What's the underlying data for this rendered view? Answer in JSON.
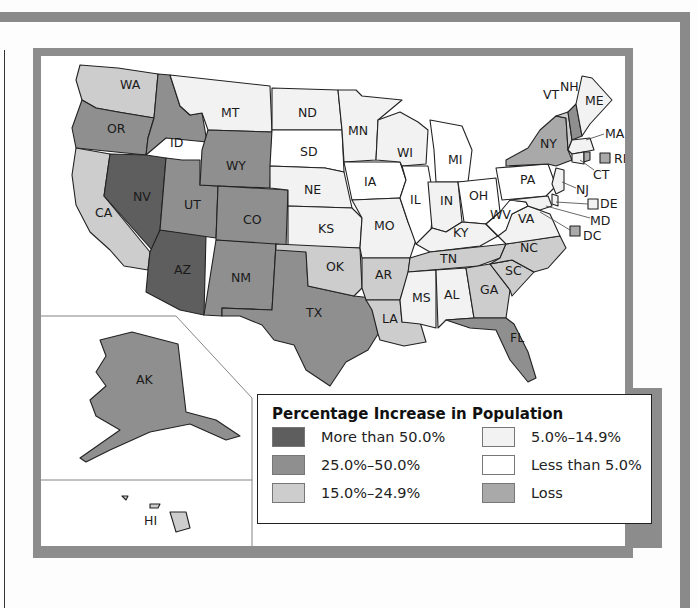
{
  "legend": {
    "title": "Percentage Increase in Population",
    "items": [
      {
        "label": "More than 50.0%",
        "color": "#5e5e5e"
      },
      {
        "label": "5.0%–14.9%",
        "color": "#f2f2f2"
      },
      {
        "label": "25.0%–50.0%",
        "color": "#8f8f8f"
      },
      {
        "label": "Less than 5.0%",
        "color": "#ffffff"
      },
      {
        "label": "15.0%–24.9%",
        "color": "#cdcdcd"
      },
      {
        "label": "Loss",
        "color": "#a9a9a9"
      }
    ]
  },
  "states": {
    "WA": "15.0%–24.9%",
    "OR": "25.0%–50.0%",
    "CA": "15.0%–24.9%",
    "ID": "25.0%–50.0%",
    "NV": "More than 50.0%",
    "AZ": "More than 50.0%",
    "UT": "25.0%–50.0%",
    "MT": "5.0%–14.9%",
    "WY": "25.0%–50.0%",
    "CO": "25.0%–50.0%",
    "NM": "25.0%–50.0%",
    "TX": "25.0%–50.0%",
    "ND": "5.0%–14.9%",
    "SD": "Less than 5.0%",
    "NE": "5.0%–14.9%",
    "KS": "5.0%–14.9%",
    "OK": "15.0%–24.9%",
    "MN": "5.0%–14.9%",
    "IA": "Less than 5.0%",
    "MO": "5.0%–14.9%",
    "AR": "15.0%–24.9%",
    "LA": "15.0%–24.9%",
    "WI": "5.0%–14.9%",
    "IL": "Less than 5.0%",
    "MI": "Less than 5.0%",
    "IN": "5.0%–14.9%",
    "OH": "Less than 5.0%",
    "KY": "5.0%–14.9%",
    "TN": "15.0%–24.9%",
    "MS": "5.0%–14.9%",
    "AL": "5.0%–14.9%",
    "GA": "15.0%–24.9%",
    "FL": "25.0%–50.0%",
    "SC": "15.0%–24.9%",
    "NC": "15.0%–24.9%",
    "VA": "5.0%–14.9%",
    "WV": "Less than 5.0%",
    "PA": "Less than 5.0%",
    "NY": "Loss",
    "VT": "15.0%–24.9%",
    "NH": "25.0%–50.0%",
    "ME": "5.0%–14.9%",
    "MA": "5.0%–14.9%",
    "RI": "Loss",
    "CT": "5.0%–14.9%",
    "NJ": "5.0%–14.9%",
    "DE": "5.0%–14.9%",
    "MD": "5.0%–14.9%",
    "DC": "Loss",
    "AK": "25.0%–50.0%",
    "HI": "15.0%–24.9%"
  },
  "labels": {
    "WA": "WA",
    "OR": "OR",
    "CA": "CA",
    "ID": "ID",
    "NV": "NV",
    "AZ": "AZ",
    "UT": "UT",
    "MT": "MT",
    "WY": "WY",
    "CO": "CO",
    "NM": "NM",
    "TX": "TX",
    "ND": "ND",
    "SD": "SD",
    "NE": "NE",
    "KS": "KS",
    "OK": "OK",
    "MN": "MN",
    "IA": "IA",
    "MO": "MO",
    "AR": "AR",
    "LA": "LA",
    "WI": "WI",
    "IL": "IL",
    "MI": "MI",
    "IN": "IN",
    "OH": "OH",
    "KY": "KY",
    "TN": "TN",
    "MS": "MS",
    "AL": "AL",
    "GA": "GA",
    "FL": "FL",
    "SC": "SC",
    "NC": "NC",
    "VA": "VA",
    "WV": "WV",
    "PA": "PA",
    "NY": "NY",
    "VT": "VT",
    "NH": "NH",
    "ME": "ME",
    "MA": "MA",
    "RI": "RI",
    "CT": "CT",
    "NJ": "NJ",
    "DE": "DE",
    "MD": "MD",
    "DC": "DC",
    "AK": "AK",
    "HI": "HI"
  }
}
